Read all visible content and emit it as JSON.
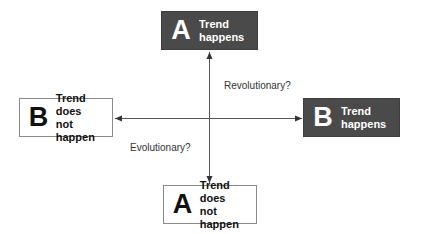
{
  "diagram": {
    "type": "two-axis trend scenario diagram",
    "colors": {
      "dark_box": "#4a4a4a",
      "light_box_border": "#8a8a8a",
      "arrow": "#333333",
      "text_dark": "#111111",
      "text_light": "#ffffff"
    },
    "nodes": {
      "top": {
        "letter": "A",
        "line1": "Trend",
        "line2": "happens",
        "style": "dark"
      },
      "bottom": {
        "letter": "A",
        "line1": "Trend does",
        "line2": "not happen",
        "style": "light"
      },
      "left": {
        "letter": "B",
        "line1": "Trend does",
        "line2": "not happen",
        "style": "light"
      },
      "right": {
        "letter": "B",
        "line1": "Trend",
        "line2": "happens",
        "style": "dark"
      }
    },
    "captions": {
      "upper_right": "Revolutionary?",
      "lower_left": "Evolutionary?"
    },
    "axes": [
      {
        "name": "vertical-axis",
        "from": "bottom",
        "to": "top",
        "arrowheads": "both"
      },
      {
        "name": "horizontal-axis",
        "from": "left",
        "to": "right",
        "arrowheads": "both"
      }
    ]
  }
}
